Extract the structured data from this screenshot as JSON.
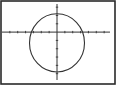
{
  "screen": {
    "type": "graphing-calculator-display",
    "frame_color": "#2a2a2a",
    "background_color": "#ffffff",
    "line_color": "#333333"
  },
  "chart_data": {
    "type": "line",
    "title": "",
    "xlabel": "",
    "ylabel": "",
    "grid": false,
    "legend": null,
    "axes": {
      "x_ticks": 14,
      "y_ticks": 9,
      "tick_spacing": 1
    },
    "window": {
      "xmin": -7,
      "xmax": 7,
      "ymin": -6,
      "ymax": 3.5
    },
    "series": [
      {
        "name": "circle",
        "shape": "circle",
        "center": [
          0,
          -1.3
        ],
        "radius": 3.5
      }
    ]
  }
}
